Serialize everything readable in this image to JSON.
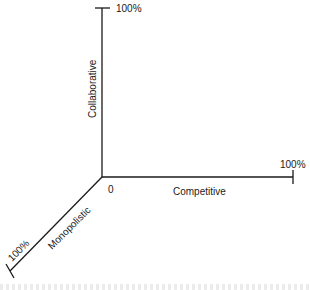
{
  "diagram": {
    "type": "three-axis",
    "origin_label": "0",
    "axes": [
      {
        "name": "Collaborative",
        "direction": "up",
        "max_label": "100%"
      },
      {
        "name": "Competitive",
        "direction": "right",
        "max_label": "100%"
      },
      {
        "name": "Monopolistic",
        "direction": "down-left",
        "max_label": "100%"
      }
    ]
  }
}
